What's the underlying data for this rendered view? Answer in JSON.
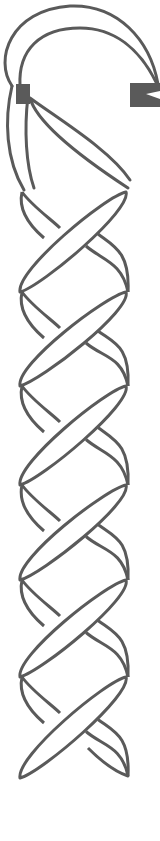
{
  "illustration": {
    "subject": "braided lanyard with hook",
    "colors": {
      "background": "#ffffff",
      "stroke": "#5a5a5a",
      "fill_block": "#5a5a5a"
    },
    "stroke_width": 3,
    "hook": {
      "outer_path": "M 12 86 C -6 60, 10 10, 70 6 C 118 4, 150 40, 158 84",
      "inner_path": "M 20 86 C 18 50, 40 28, 80 28 C 115 28, 140 50, 156 82",
      "left_leg_outer": "M 12 86 C 4 120, 6 160, 24 190",
      "left_leg_inner": "M 28 96 C 24 130, 26 165, 34 188",
      "left_block": {
        "x": 16,
        "y": 84,
        "w": 14,
        "h": 20
      },
      "right_block": {
        "x": 130,
        "y": 83,
        "w": 30,
        "h": 24
      },
      "right_block_notch": "M 146 94 L 160 91 L 160 99 Z"
    },
    "top_strand": "M 30 98 C 36 120, 70 150, 128 188 M 30 98 C 60 120, 110 150, 130 180",
    "nodes_y": [
      192,
      292,
      386,
      485,
      580,
      677
    ],
    "left_x": 22,
    "right_x": 126,
    "bottom": {
      "left_tip": [
        18,
        778
      ],
      "right_tip": [
        128,
        776
      ]
    }
  }
}
